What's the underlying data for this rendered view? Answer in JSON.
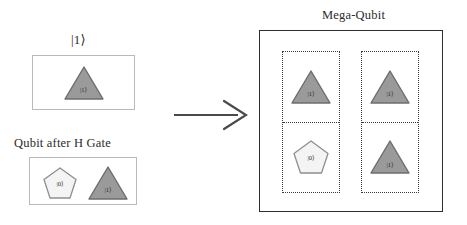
{
  "diagram": {
    "title_right": "Mega-Qubit",
    "label_ket_one": "|1⟩",
    "label_after_h": "Qubit after H Gate",
    "arrow": "right-arrow",
    "colors": {
      "triangle_fill": "#9a9a9a",
      "triangle_stroke": "#6d6d6d",
      "pentagon_fill": "#f4f4f4",
      "pentagon_stroke": "#8f8f8f",
      "box_border": "#b9b9b9",
      "mega_border": "#2e2e2e",
      "dotted_border": "#3a3a3a",
      "text": "#2b2b2b"
    },
    "states": {
      "one": "|1⟩",
      "zero": "|0⟩"
    }
  },
  "left_panel": {
    "top_group": {
      "caption": "|1⟩",
      "shapes": [
        {
          "type": "triangle",
          "label": "|1⟩",
          "state": "one"
        }
      ]
    },
    "bottom_group": {
      "caption": "Qubit after H Gate",
      "shapes": [
        {
          "type": "pentagon",
          "label": "|0⟩",
          "state": "zero"
        },
        {
          "type": "triangle",
          "label": "|1⟩",
          "state": "one"
        }
      ]
    }
  },
  "mega_qubit": {
    "caption": "Mega-Qubit",
    "columns": [
      {
        "name": "column-left",
        "cells": [
          {
            "position": "top",
            "shape": "triangle",
            "label": "|1⟩"
          },
          {
            "position": "bottom",
            "shape": "pentagon",
            "label": "|0⟩"
          }
        ]
      },
      {
        "name": "column-right",
        "cells": [
          {
            "position": "top",
            "shape": "triangle",
            "label": "|1⟩"
          },
          {
            "position": "bottom",
            "shape": "triangle",
            "label": "|1⟩"
          }
        ]
      }
    ]
  }
}
